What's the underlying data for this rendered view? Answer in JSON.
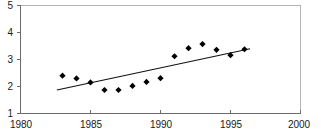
{
  "chart_data": {
    "type": "scatter",
    "title": "",
    "subtitle": "",
    "xlabel": "",
    "ylabel": "",
    "xlim": [
      1980,
      2000
    ],
    "ylim": [
      1,
      5
    ],
    "xticks": [
      1980,
      1985,
      1990,
      1995,
      2000
    ],
    "yticks": [
      1,
      2,
      3,
      4,
      5
    ],
    "xtick_labels": [
      "1980",
      "1985",
      "1990",
      "1995",
      "2000"
    ],
    "ytick_labels": [
      "1",
      "2",
      "3",
      "4",
      "5"
    ],
    "grid": false,
    "legend": null,
    "marker": "diamond",
    "marker_color": "#000000",
    "series": [
      {
        "name": "observations",
        "type": "scatter",
        "x": [
          1983,
          1984,
          1985,
          1986,
          1987,
          1988,
          1989,
          1990,
          1991,
          1992,
          1993,
          1994,
          1995,
          1996
        ],
        "values": [
          2.4,
          2.3,
          2.15,
          1.87,
          1.87,
          2.02,
          2.17,
          2.31,
          3.12,
          3.42,
          3.57,
          3.36,
          3.16,
          3.38
        ]
      },
      {
        "name": "trend-line",
        "type": "line",
        "x": [
          1982.6,
          1996.4
        ],
        "values": [
          1.87,
          3.4
        ]
      }
    ]
  },
  "axes": {
    "y_axis_name": "value-axis",
    "x_axis_name": "year-axis"
  }
}
